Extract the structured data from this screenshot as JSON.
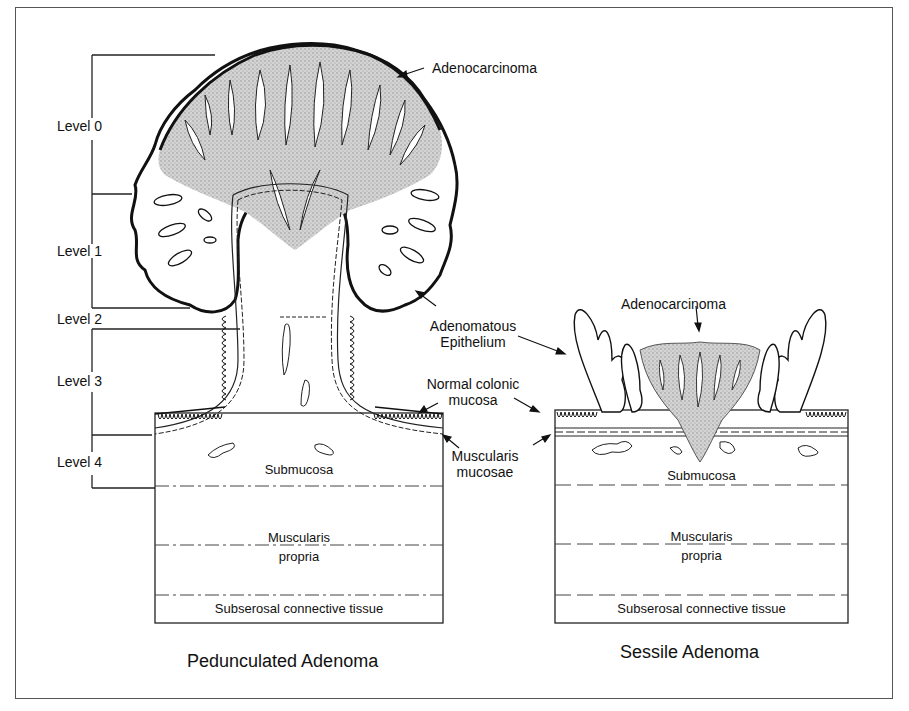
{
  "figure": {
    "panels": [
      {
        "title": "Pedunculated Adenoma",
        "levels": [
          "Level 0",
          "Level 1",
          "Level 2",
          "Level 3",
          "Level 4"
        ],
        "callouts": {
          "adenocarcinoma": "Adenocarcinoma"
        },
        "layers": {
          "submucosa": "Submucosa",
          "muscularis_propria_line1": "Muscularis",
          "muscularis_propria_line2": "propria",
          "subserosal": "Subserosal connective tissue"
        }
      },
      {
        "title": "Sessile Adenoma",
        "callouts": {
          "adenocarcinoma": "Adenocarcinoma"
        },
        "layers": {
          "submucosa": "Submucosa",
          "muscularis_propria_line1": "Muscularis",
          "muscularis_propria_line2": "propria",
          "subserosal": "Subserosal connective tissue"
        }
      }
    ],
    "shared_callouts": {
      "adenomatous_epithelium_line1": "Adenomatous",
      "adenomatous_epithelium_line2": "Epithelium",
      "normal_colonic_mucosa_line1": "Normal colonic",
      "normal_colonic_mucosa_line2": "mucosa",
      "muscularis_mucosae_line1": "Muscularis",
      "muscularis_mucosae_line2": "mucosae"
    }
  }
}
